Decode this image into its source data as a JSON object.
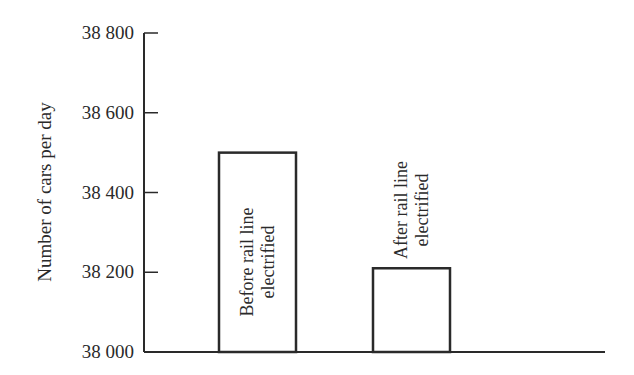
{
  "chart_data": {
    "type": "bar",
    "title": "",
    "xlabel": "",
    "ylabel": "Number of cars per day",
    "ylim": [
      38000,
      38800
    ],
    "yticks": [
      38000,
      38200,
      38400,
      38600,
      38800
    ],
    "ytick_labels": [
      "38 000",
      "38 200",
      "38 400",
      "38 600",
      "38 800"
    ],
    "categories": [
      "Before rail line electrified",
      "After rail line electrified"
    ],
    "category_labels": [
      [
        "Before rail line",
        "electrified"
      ],
      [
        "After rail line",
        "electrified"
      ]
    ],
    "values": [
      38500,
      38210
    ],
    "bar_label_position": [
      "inside",
      "above"
    ],
    "grid": false,
    "legend": null,
    "colors": {
      "bar_fill": "#ffffff",
      "bar_stroke": "#2a2a2a",
      "axis": "#2a2a2a"
    }
  }
}
